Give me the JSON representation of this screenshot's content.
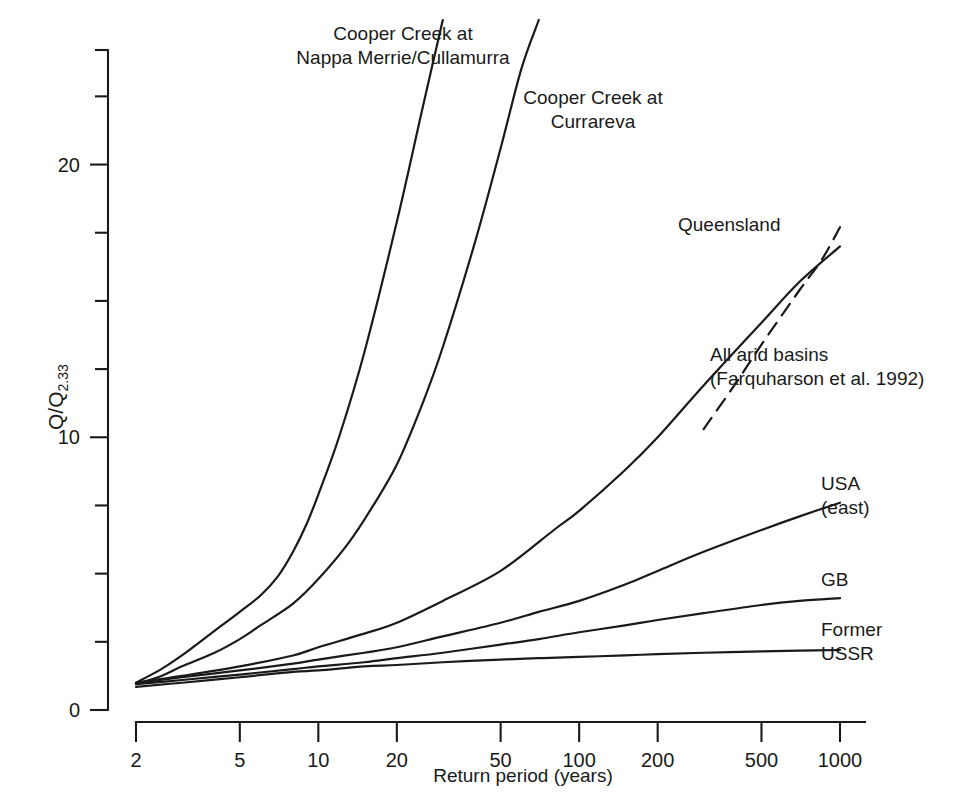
{
  "chart_data": {
    "type": "line",
    "title": "",
    "xlabel": "Return period (years)",
    "ylabel": "Q/Q",
    "ylabel_sub": "2.33",
    "xscale": "log",
    "yscale": "linear",
    "xlim": [
      2,
      1000
    ],
    "ylim": [
      0,
      24.2
    ],
    "xticks": [
      2,
      5,
      10,
      20,
      50,
      100,
      200,
      500,
      1000
    ],
    "xtick_labels": [
      "2",
      "5",
      "10",
      "20",
      "50",
      "100",
      "200",
      "500",
      "1000"
    ],
    "yticks": [
      0,
      2.5,
      5,
      7.5,
      10,
      12.5,
      15,
      17.5,
      20,
      22.5,
      24.2
    ],
    "ytick_labels": [
      "0",
      "",
      "",
      "",
      "10",
      "",
      "",
      "",
      "20",
      "",
      ""
    ],
    "ylabeled_ticks": [
      0,
      10,
      20
    ],
    "grid": false,
    "legend": "inline-annotations",
    "series": [
      {
        "name": "Cooper Creek at Nappa Merrie/Cullamurra",
        "style": "solid",
        "x": [
          2,
          2.5,
          3,
          4,
          5,
          6,
          7,
          8,
          9,
          10,
          12,
          15,
          20,
          25,
          30
        ],
        "y": [
          1.0,
          1.5,
          2.0,
          2.9,
          3.6,
          4.2,
          4.9,
          5.8,
          6.8,
          7.9,
          10.0,
          13.1,
          17.9,
          22.0,
          25.3
        ]
      },
      {
        "name": "Cooper Creek at Currareva",
        "style": "solid",
        "x": [
          2,
          2.5,
          3,
          4,
          5,
          6,
          8,
          10,
          13,
          16,
          20,
          25,
          30,
          40,
          50,
          60,
          70
        ],
        "y": [
          0.95,
          1.25,
          1.6,
          2.1,
          2.6,
          3.1,
          3.9,
          4.8,
          6.1,
          7.4,
          9.0,
          11.2,
          13.3,
          17.2,
          20.6,
          23.5,
          25.3
        ]
      },
      {
        "name": "All arid basins (Farquharson et al. 1992)",
        "style": "solid",
        "x": [
          2,
          3,
          5,
          8,
          10,
          15,
          20,
          30,
          50,
          80,
          100,
          150,
          200,
          300,
          500,
          700,
          1000
        ],
        "y": [
          1.0,
          1.25,
          1.6,
          2.0,
          2.3,
          2.8,
          3.2,
          4.0,
          5.1,
          6.6,
          7.3,
          8.8,
          10.0,
          11.9,
          14.2,
          15.7,
          17.0
        ]
      },
      {
        "name": "Queensland",
        "style": "dashed",
        "x": [
          300,
          400,
          500,
          700,
          850,
          1000
        ],
        "y": [
          10.3,
          12.0,
          13.4,
          15.4,
          16.5,
          17.7
        ]
      },
      {
        "name": "USA (east)",
        "style": "solid",
        "x": [
          2,
          3,
          5,
          8,
          10,
          15,
          20,
          30,
          50,
          70,
          100,
          150,
          200,
          300,
          500,
          700,
          1000
        ],
        "y": [
          0.98,
          1.2,
          1.45,
          1.7,
          1.85,
          2.1,
          2.3,
          2.7,
          3.2,
          3.6,
          4.0,
          4.6,
          5.1,
          5.8,
          6.6,
          7.1,
          7.6
        ]
      },
      {
        "name": "GB",
        "style": "solid",
        "x": [
          2,
          3,
          5,
          8,
          10,
          15,
          20,
          30,
          50,
          70,
          100,
          150,
          200,
          300,
          500,
          700,
          1000
        ],
        "y": [
          0.95,
          1.1,
          1.3,
          1.5,
          1.6,
          1.75,
          1.9,
          2.1,
          2.4,
          2.6,
          2.85,
          3.1,
          3.3,
          3.55,
          3.85,
          4.0,
          4.1
        ]
      },
      {
        "name": "Former USSR",
        "style": "solid",
        "x": [
          2,
          3,
          5,
          8,
          10,
          15,
          20,
          30,
          50,
          70,
          100,
          150,
          200,
          300,
          500,
          700,
          1000
        ],
        "y": [
          0.85,
          1.0,
          1.2,
          1.4,
          1.45,
          1.6,
          1.65,
          1.75,
          1.85,
          1.9,
          1.95,
          2.0,
          2.05,
          2.1,
          2.15,
          2.18,
          2.2
        ]
      }
    ]
  },
  "annotations": [
    {
      "id": "cooper-nappa-merrie",
      "lines": [
        "Cooper Creek at",
        "Nappa Merrie/Cullamurra"
      ],
      "x": 253,
      "y": 22,
      "width": 300,
      "align": "center"
    },
    {
      "id": "cooper-currareva",
      "lines": [
        "Cooper Creek at",
        "Currareva"
      ],
      "x": 503,
      "y": 86,
      "width": 180,
      "align": "center"
    },
    {
      "id": "queensland",
      "lines": [
        "Queensland"
      ],
      "x": 678,
      "y": 213,
      "width": 140,
      "align": "left"
    },
    {
      "id": "all-arid-basins",
      "lines": [
        "All arid basins",
        "(Farquharson et al. 1992)"
      ],
      "x": 710,
      "y": 343,
      "width": 260,
      "align": "left"
    },
    {
      "id": "usa-east",
      "lines": [
        "USA",
        "(east)"
      ],
      "x": 821,
      "y": 472,
      "width": 90,
      "align": "left"
    },
    {
      "id": "gb",
      "lines": [
        "GB"
      ],
      "x": 821,
      "y": 568,
      "width": 60,
      "align": "left"
    },
    {
      "id": "former-ussr",
      "lines": [
        "Former",
        "USSR"
      ],
      "x": 821,
      "y": 618,
      "width": 90,
      "align": "left"
    }
  ],
  "colors": {
    "ink": "#1a1a1a",
    "background": "#ffffff"
  }
}
